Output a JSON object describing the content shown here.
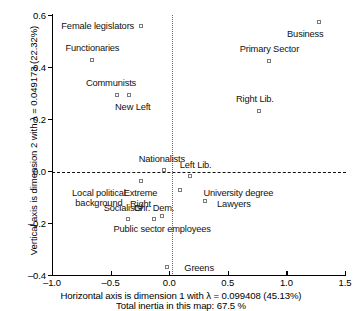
{
  "chart_data": {
    "type": "scatter",
    "title": "",
    "xlabel": "Horizontal axis is dimension 1 with λ = 0.099408 (45.13%)",
    "xlabel_line2": "Total inertia in this map: 67.5 %",
    "ylabel": "Vertical axis is dimension 2 with λ = 0.049173 (22.32%)",
    "xlim": [
      -1.0,
      1.5
    ],
    "ylim": [
      -0.4,
      0.6
    ],
    "xticks": [
      "-1.0",
      "-0.5",
      "0.0",
      "0.5",
      "1.0",
      "1.5"
    ],
    "xtick_values": [
      -1.0,
      -0.5,
      0.0,
      0.5,
      1.0,
      1.5
    ],
    "yticks": [
      "0.6",
      "0.4",
      "0.2",
      "0.0",
      "-0.2",
      "-0.4"
    ],
    "ytick_values": [
      0.6,
      0.4,
      0.2,
      0.0,
      -0.2,
      -0.4
    ],
    "grid": false,
    "legend": "none",
    "reference_lines": [
      {
        "axis": "horizontal",
        "value": 0.0,
        "style": "dashed"
      },
      {
        "axis": "vertical",
        "value": 0.0,
        "style": "dotted"
      }
    ],
    "marker": "open-square",
    "points": [
      {
        "label": "Female legislators",
        "x": -0.24,
        "y": 0.558,
        "label_pos": "right",
        "label_dx": -7,
        "label_dy": 0
      },
      {
        "label": "Business",
        "x": 1.275,
        "y": 0.572,
        "label_pos": "right",
        "label_dx": 5,
        "label_dy": 12
      },
      {
        "label": "Functionaries",
        "x": -0.655,
        "y": 0.428,
        "label_pos": "center",
        "label_dx": 0,
        "label_dy": -11
      },
      {
        "label": "Primary Sector",
        "x": 0.855,
        "y": 0.425,
        "label_pos": "center",
        "label_dx": 0,
        "label_dy": -11
      },
      {
        "label": "Communists",
        "x": -0.445,
        "y": 0.293,
        "label_pos": "center",
        "label_dx": -6,
        "label_dy": -11
      },
      {
        "label": "New Left",
        "x": -0.345,
        "y": 0.293,
        "label_pos": "center",
        "label_dx": 4,
        "label_dy": 12
      },
      {
        "label": "Right Lib.",
        "x": 0.765,
        "y": 0.232,
        "label_pos": "center",
        "label_dx": -4,
        "label_dy": -11
      },
      {
        "label": "Nationalists",
        "x": -0.045,
        "y": 0.005,
        "label_pos": "center",
        "label_dx": -2,
        "label_dy": -10
      },
      {
        "label": "Left Lib.",
        "x": 0.175,
        "y": -0.018,
        "label_pos": "center",
        "label_dx": 6,
        "label_dy": -10
      },
      {
        "label": "Extreme\nRight",
        "x": -0.245,
        "y": -0.04,
        "label_pos": "center",
        "label_dx": 0,
        "label_dy": 12
      },
      {
        "label": "Local political\nbackground",
        "x": -0.6,
        "y": -0.045,
        "label_pos": "center",
        "label_dx": 0,
        "label_dy": 10,
        "no_marker": true
      },
      {
        "label": "University degree",
        "x": 0.095,
        "y": -0.072,
        "label_pos": "center",
        "label_dx": 58,
        "label_dy": 3
      },
      {
        "label": "Lawyers",
        "x": 0.305,
        "y": -0.115,
        "label_pos": "center",
        "label_dx": 29,
        "label_dy": 3
      },
      {
        "label": "Socialists",
        "x": -0.355,
        "y": -0.185,
        "label_pos": "center",
        "label_dx": -5,
        "label_dy": -10
      },
      {
        "label": "Chr. Dem.",
        "x": -0.13,
        "y": -0.185,
        "label_pos": "center",
        "label_dx": 0,
        "label_dy": -10
      },
      {
        "label": "Public sector employees",
        "x": -0.06,
        "y": -0.172,
        "label_pos": "center",
        "label_dx": 0,
        "label_dy": 13
      },
      {
        "label": "Greens",
        "x": -0.018,
        "y": -0.37,
        "label_pos": "center",
        "label_dx": 32,
        "label_dy": 1
      }
    ]
  }
}
